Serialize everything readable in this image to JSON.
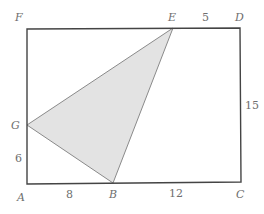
{
  "figure": {
    "type": "geometry",
    "rectangle": {
      "vertices": [
        "A",
        "C",
        "D",
        "F"
      ],
      "stroke": "#444444"
    },
    "shaded_triangle": {
      "vertices": [
        "G",
        "B",
        "E"
      ],
      "fill": "#e3e3e3",
      "stroke": "#8a8a8a"
    },
    "points": {
      "A": {
        "label": "A"
      },
      "B": {
        "label": "B"
      },
      "C": {
        "label": "C"
      },
      "D": {
        "label": "D"
      },
      "E": {
        "label": "E"
      },
      "F": {
        "label": "F"
      },
      "G": {
        "label": "G"
      }
    },
    "measurements": {
      "ED": "5",
      "DC": "15",
      "AG": "6",
      "AB": "8",
      "BC": "12"
    }
  }
}
